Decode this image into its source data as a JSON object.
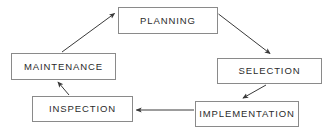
{
  "diagram": {
    "type": "cycle-flow-diagram",
    "background_color": "#ffffff",
    "box_border_color": "#8a8a8a",
    "arrow_color": "#3a3a3a",
    "text_color": "#2b2b2b",
    "direction": "clockwise",
    "nodes": [
      {
        "id": "planning",
        "label": "PLANNING",
        "position": "top"
      },
      {
        "id": "selection",
        "label": "SELECTION",
        "position": "right"
      },
      {
        "id": "implementation",
        "label": "IMPLEMENTATION",
        "position": "bottom-right"
      },
      {
        "id": "inspection",
        "label": "INSPECTION",
        "position": "bottom-left"
      },
      {
        "id": "maintenance",
        "label": "MAINTENANCE",
        "position": "left"
      }
    ],
    "edges": [
      {
        "id": "planning-to-selection",
        "from": "PLANNING",
        "to": "SELECTION",
        "style": "diagonal-down-right"
      },
      {
        "id": "selection-to-implementation",
        "from": "SELECTION",
        "to": "IMPLEMENTATION",
        "style": "diagonal-down-left"
      },
      {
        "id": "implementation-to-inspection",
        "from": "IMPLEMENTATION",
        "to": "INSPECTION",
        "style": "horizontal-left"
      },
      {
        "id": "inspection-to-maintenance",
        "from": "INSPECTION",
        "to": "MAINTENANCE",
        "style": "diagonal-up-left"
      },
      {
        "id": "maintenance-to-planning",
        "from": "MAINTENANCE",
        "to": "PLANNING",
        "style": "diagonal-up-right"
      }
    ]
  }
}
